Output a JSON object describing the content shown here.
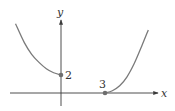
{
  "chart_data": {
    "type": "line",
    "title": "",
    "xlabel": "x",
    "ylabel": "y",
    "xlim": [
      -3.1,
      6.6
    ],
    "ylim": [
      -1.3,
      8.2
    ],
    "grid": false,
    "legend": "none",
    "series": [
      {
        "name": "left-branch",
        "description": "decreasing concave-up curve ending at closed point (0, 2)",
        "points": [
          [
            -3.1,
            7.7
          ],
          [
            -2.5,
            5.6
          ],
          [
            -2.0,
            4.3
          ],
          [
            -1.5,
            3.4
          ],
          [
            -1.0,
            2.7
          ],
          [
            -0.5,
            2.25
          ],
          [
            0,
            2
          ]
        ]
      },
      {
        "name": "right-branch",
        "description": "increasing concave-up curve starting at closed point (3, 0)",
        "points": [
          [
            3,
            0
          ],
          [
            3.5,
            0.25
          ],
          [
            4.0,
            0.8
          ],
          [
            4.5,
            1.8
          ],
          [
            5.0,
            3.3
          ],
          [
            5.5,
            5.2
          ],
          [
            5.95,
            7.0
          ]
        ]
      }
    ],
    "marked_points": [
      {
        "x": 0,
        "y": 2,
        "label": "2"
      },
      {
        "x": 3,
        "y": 0,
        "label": "3"
      }
    ]
  }
}
